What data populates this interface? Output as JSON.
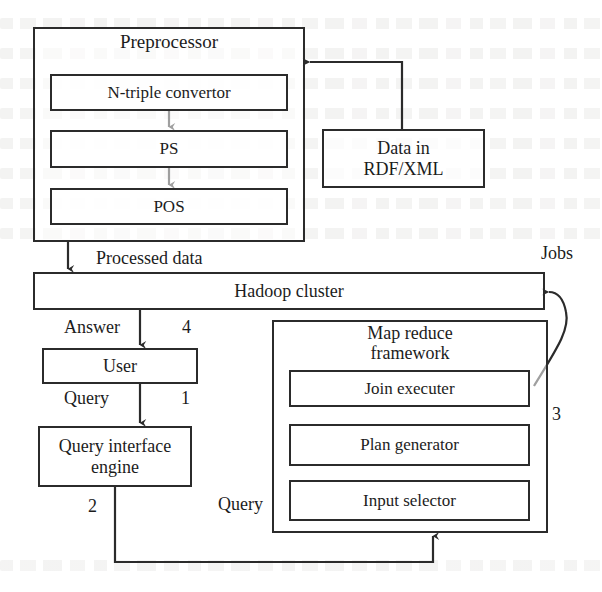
{
  "figure": {
    "type": "architecture-block-diagram"
  },
  "groups": {
    "preprocessor": {
      "title": "Preprocessor",
      "x": 33,
      "y": 27,
      "w": 272,
      "h": 215,
      "children": [
        {
          "id": "ntriple",
          "label": "N-triple convertor",
          "x": 50,
          "y": 74,
          "w": 238,
          "h": 37,
          "font": 17
        },
        {
          "id": "ps",
          "label": "PS",
          "x": 50,
          "y": 130,
          "w": 238,
          "h": 38,
          "font": 17
        },
        {
          "id": "pos",
          "label": "POS",
          "x": 50,
          "y": 188,
          "w": 238,
          "h": 37,
          "font": 17
        }
      ]
    },
    "mapreduce": {
      "title": "Map reduce\nframework",
      "x": 272,
      "y": 320,
      "w": 276,
      "h": 213,
      "children": [
        {
          "id": "join-executer",
          "label": "Join executer",
          "x": 289,
          "y": 370,
          "w": 241,
          "h": 37,
          "font": 17
        },
        {
          "id": "plan-generator",
          "label": "Plan generator",
          "x": 289,
          "y": 424,
          "w": 241,
          "h": 42,
          "font": 17
        },
        {
          "id": "input-selector",
          "label": "Input selector",
          "x": 289,
          "y": 480,
          "w": 241,
          "h": 41,
          "font": 17
        }
      ]
    }
  },
  "nodes": [
    {
      "id": "data-rdf-xml",
      "label": "Data in\nRDF/XML",
      "x": 322,
      "y": 129,
      "w": 163,
      "h": 59,
      "font": 18
    },
    {
      "id": "hadoop-cluster",
      "label": "Hadoop cluster",
      "x": 33,
      "y": 272,
      "w": 512,
      "h": 38,
      "font": 18
    },
    {
      "id": "user",
      "label": "User",
      "x": 42,
      "y": 348,
      "w": 156,
      "h": 36,
      "font": 18
    },
    {
      "id": "query-interface-engine",
      "label": "Query interface\nengine",
      "x": 38,
      "y": 426,
      "w": 154,
      "h": 61,
      "font": 18
    }
  ],
  "edge_labels": [
    {
      "id": "processed-data",
      "text": "Processed data",
      "x": 96,
      "y": 248,
      "font": 18
    },
    {
      "id": "jobs",
      "text": "Jobs",
      "x": 541,
      "y": 243,
      "font": 18
    },
    {
      "id": "answer",
      "text": "Answer",
      "x": 64,
      "y": 317,
      "font": 18
    },
    {
      "id": "step-4",
      "text": "4",
      "x": 182,
      "y": 317,
      "font": 18
    },
    {
      "id": "query-user",
      "text": "Query",
      "x": 64,
      "y": 388,
      "font": 18
    },
    {
      "id": "step-1",
      "text": "1",
      "x": 181,
      "y": 388,
      "font": 18
    },
    {
      "id": "step-2",
      "text": "2",
      "x": 88,
      "y": 496,
      "font": 18
    },
    {
      "id": "query-bottom",
      "text": "Query",
      "x": 218,
      "y": 494,
      "font": 18
    },
    {
      "id": "step-3",
      "text": "3",
      "x": 552,
      "y": 404,
      "font": 18
    }
  ],
  "connectors": [
    {
      "id": "rdf-to-preprocessor",
      "from": "data-rdf-xml",
      "to": "preprocessor",
      "arrow": "left"
    },
    {
      "id": "preprocessor-to-hadoop",
      "from": "preprocessor",
      "to": "hadoop-cluster",
      "arrow": "down",
      "label": "Processed data"
    },
    {
      "id": "ntriple-to-ps",
      "from": "ntriple",
      "to": "ps",
      "arrow": "down"
    },
    {
      "id": "ps-to-pos",
      "from": "ps",
      "to": "pos",
      "arrow": "down"
    },
    {
      "id": "hadoop-to-user",
      "from": "hadoop-cluster",
      "to": "user",
      "arrow": "down",
      "label": "Answer",
      "step": "4"
    },
    {
      "id": "user-to-query-engine",
      "from": "user",
      "to": "query-interface-engine",
      "arrow": "down",
      "label": "Query",
      "step": "1"
    },
    {
      "id": "query-engine-to-mapreduce",
      "from": "query-interface-engine",
      "to": "mapreduce",
      "arrow": "up",
      "label": "Query",
      "step": "2"
    },
    {
      "id": "mapreduce-to-hadoop",
      "from": "join-executer",
      "to": "hadoop-cluster",
      "arrow": "curve-left",
      "label": "Jobs",
      "step": "3"
    }
  ],
  "colors": {
    "stroke": "#2b2b2b",
    "text": "#1c1c1c",
    "background": "#ffffff"
  }
}
